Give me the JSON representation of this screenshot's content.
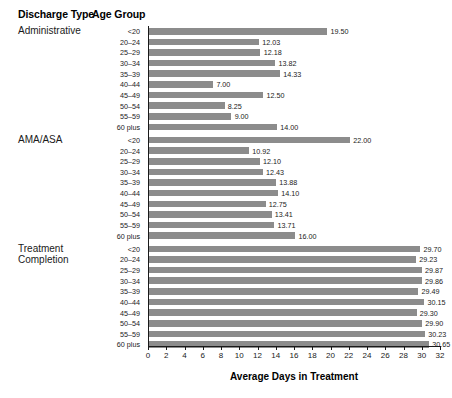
{
  "table_headers": {
    "discharge_type": "Discharge Type",
    "age_group": "Age Group"
  },
  "chart_data": {
    "type": "bar",
    "orientation": "horizontal",
    "title": "",
    "xlabel": "Average Days in Treatment",
    "ylabel": "",
    "xlim": [
      0,
      32
    ],
    "xticks": [
      0,
      2,
      4,
      6,
      8,
      10,
      12,
      14,
      16,
      18,
      20,
      22,
      24,
      26,
      28,
      30,
      32
    ],
    "grid": false,
    "legend": "none",
    "bar_color": "#8c8c8c",
    "axis_color": "#1a1a1a",
    "value_label_format": "2 decimals",
    "categories": [
      "<20",
      "20–24",
      "25–29",
      "30–34",
      "35–39",
      "40–44",
      "45–49",
      "50–54",
      "55–59",
      "60 plus"
    ],
    "groups": [
      {
        "name": "Administrative",
        "values": [
          19.5,
          12.03,
          12.18,
          13.82,
          14.33,
          7.0,
          12.5,
          8.25,
          9.0,
          14.0
        ],
        "labels": [
          "19.50",
          "12.03",
          "12.18",
          "13.82",
          "14.33",
          "7.00",
          "12.50",
          "8.25",
          "9.00",
          "14.00"
        ]
      },
      {
        "name": "AMA/ASA",
        "values": [
          22.0,
          10.92,
          12.1,
          12.43,
          13.88,
          14.1,
          12.75,
          13.41,
          13.71,
          16.0
        ],
        "labels": [
          "22.00",
          "10.92",
          "12.10",
          "12.43",
          "13.88",
          "14.10",
          "12.75",
          "13.41",
          "13.71",
          "16.00"
        ]
      },
      {
        "name": "Treatment\nCompletion",
        "values": [
          29.7,
          29.23,
          29.87,
          29.86,
          29.49,
          30.15,
          29.3,
          29.9,
          30.23,
          30.65
        ],
        "labels": [
          "29.70",
          "29.23",
          "29.87",
          "29.86",
          "29.49",
          "30.15",
          "29.30",
          "29.90",
          "30.23",
          "30.65"
        ]
      }
    ]
  }
}
